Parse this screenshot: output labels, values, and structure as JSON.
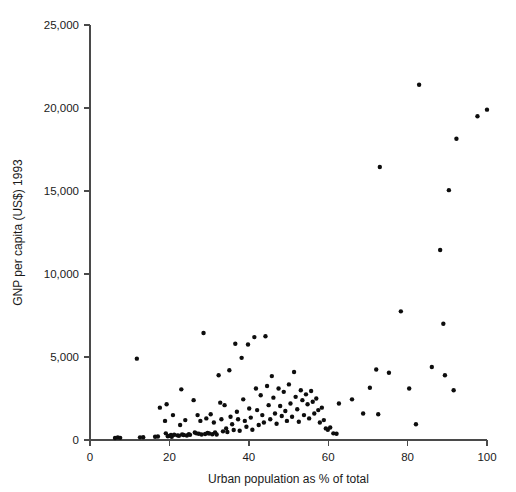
{
  "chart_data": {
    "type": "scatter",
    "title": "",
    "xlabel": "Urban population as % of total",
    "ylabel": "GNP per capita (US$) 1993",
    "xlim": [
      0,
      100
    ],
    "ylim": [
      0,
      25000
    ],
    "grid": false,
    "legend": null,
    "xticks": [
      0,
      20,
      40,
      60,
      80,
      100
    ],
    "xtick_labels": [
      "0",
      "20",
      "40",
      "60",
      "80",
      "100"
    ],
    "yticks": [
      0,
      5000,
      10000,
      15000,
      20000,
      25000
    ],
    "ytick_labels": [
      "0",
      "5,000",
      "10,000",
      "15,000",
      "20,000",
      "25,000"
    ],
    "marker": "circle",
    "marker_color": "#0d0d0d",
    "marker_size_px": 4.4,
    "n_points": 133,
    "points": [
      [
        6.3,
        120
      ],
      [
        7.0,
        150
      ],
      [
        7.6,
        130
      ],
      [
        11.8,
        4900
      ],
      [
        12.6,
        160
      ],
      [
        13.4,
        170
      ],
      [
        16.4,
        200
      ],
      [
        17.1,
        210
      ],
      [
        17.6,
        1950
      ],
      [
        18.9,
        1150
      ],
      [
        19.1,
        400
      ],
      [
        19.3,
        2150
      ],
      [
        19.6,
        230
      ],
      [
        20.0,
        250
      ],
      [
        20.4,
        300
      ],
      [
        20.6,
        200
      ],
      [
        20.9,
        1500
      ],
      [
        21.2,
        320
      ],
      [
        22.0,
        280
      ],
      [
        22.4,
        260
      ],
      [
        22.7,
        900
      ],
      [
        23.0,
        3050
      ],
      [
        23.2,
        330
      ],
      [
        23.6,
        300
      ],
      [
        24.0,
        1200
      ],
      [
        24.4,
        270
      ],
      [
        24.9,
        350
      ],
      [
        25.2,
        310
      ],
      [
        26.1,
        2400
      ],
      [
        26.4,
        450
      ],
      [
        26.8,
        400
      ],
      [
        27.1,
        1500
      ],
      [
        27.4,
        380
      ],
      [
        27.8,
        1150
      ],
      [
        28.1,
        330
      ],
      [
        28.6,
        6450
      ],
      [
        29.0,
        360
      ],
      [
        29.3,
        1300
      ],
      [
        29.6,
        420
      ],
      [
        30.0,
        390
      ],
      [
        30.4,
        1550
      ],
      [
        30.8,
        350
      ],
      [
        31.2,
        1050
      ],
      [
        31.5,
        460
      ],
      [
        31.9,
        330
      ],
      [
        32.4,
        3900
      ],
      [
        32.8,
        2250
      ],
      [
        33.1,
        1250
      ],
      [
        33.5,
        520
      ],
      [
        33.9,
        2100
      ],
      [
        34.3,
        700
      ],
      [
        34.6,
        480
      ],
      [
        35.1,
        4200
      ],
      [
        35.4,
        1400
      ],
      [
        35.8,
        950
      ],
      [
        36.2,
        600
      ],
      [
        36.6,
        5800
      ],
      [
        37.0,
        1700
      ],
      [
        37.3,
        1250
      ],
      [
        37.7,
        560
      ],
      [
        38.2,
        4950
      ],
      [
        38.6,
        2450
      ],
      [
        39.0,
        1150
      ],
      [
        39.4,
        800
      ],
      [
        39.8,
        5750
      ],
      [
        40.1,
        1900
      ],
      [
        40.5,
        1350
      ],
      [
        40.9,
        620
      ],
      [
        41.4,
        6200
      ],
      [
        41.8,
        3100
      ],
      [
        42.1,
        1800
      ],
      [
        42.5,
        900
      ],
      [
        43.0,
        2700
      ],
      [
        43.4,
        1500
      ],
      [
        43.8,
        1050
      ],
      [
        44.2,
        6250
      ],
      [
        44.6,
        3250
      ],
      [
        45.0,
        2100
      ],
      [
        45.4,
        1250
      ],
      [
        45.8,
        3850
      ],
      [
        46.2,
        2550
      ],
      [
        46.6,
        1600
      ],
      [
        47.0,
        980
      ],
      [
        47.5,
        3100
      ],
      [
        47.9,
        2050
      ],
      [
        48.3,
        1450
      ],
      [
        48.8,
        2900
      ],
      [
        49.2,
        1750
      ],
      [
        49.6,
        1150
      ],
      [
        50.1,
        3350
      ],
      [
        50.5,
        2200
      ],
      [
        50.9,
        1400
      ],
      [
        51.4,
        4100
      ],
      [
        51.8,
        2600
      ],
      [
        52.2,
        1850
      ],
      [
        52.6,
        1100
      ],
      [
        53.1,
        3000
      ],
      [
        53.5,
        2400
      ],
      [
        53.9,
        1500
      ],
      [
        54.4,
        2750
      ],
      [
        54.8,
        2150
      ],
      [
        55.2,
        1300
      ],
      [
        55.7,
        2950
      ],
      [
        56.1,
        2300
      ],
      [
        56.5,
        1600
      ],
      [
        57.0,
        2500
      ],
      [
        57.5,
        1800
      ],
      [
        57.9,
        1050
      ],
      [
        58.4,
        1950
      ],
      [
        58.9,
        1200
      ],
      [
        59.4,
        700
      ],
      [
        59.9,
        620
      ],
      [
        60.5,
        750
      ],
      [
        61.3,
        400
      ],
      [
        62.1,
        380
      ],
      [
        62.7,
        2200
      ],
      [
        66.0,
        2450
      ],
      [
        68.8,
        1600
      ],
      [
        70.5,
        3150
      ],
      [
        72.1,
        4250
      ],
      [
        72.6,
        1550
      ],
      [
        73.0,
        16450
      ],
      [
        75.3,
        4050
      ],
      [
        78.3,
        7750
      ],
      [
        80.4,
        3100
      ],
      [
        82.1,
        950
      ],
      [
        82.9,
        21400
      ],
      [
        86.1,
        4400
      ],
      [
        88.2,
        11450
      ],
      [
        89.0,
        7000
      ],
      [
        89.4,
        3900
      ],
      [
        90.4,
        15050
      ],
      [
        91.6,
        3000
      ],
      [
        92.3,
        18150
      ],
      [
        97.6,
        19500
      ],
      [
        100.0,
        19900
      ]
    ]
  },
  "axes": {
    "x_axis_name": "x-axis",
    "y_axis_name": "y-axis"
  }
}
